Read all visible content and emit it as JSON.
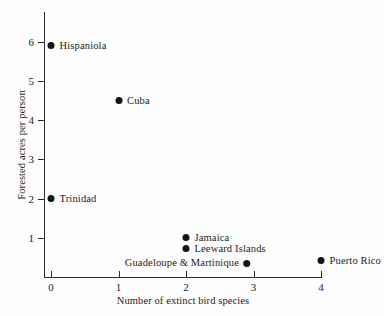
{
  "chart_data": {
    "type": "scatter",
    "title": "",
    "xlabel": "Number of extinct bird species",
    "ylabel": "Forested acres per person",
    "xlim": [
      0,
      4
    ],
    "ylim": [
      0,
      6.6
    ],
    "xticks": [
      "0",
      "1",
      "2",
      "3",
      "4"
    ],
    "xtick_values": [
      0,
      1,
      2,
      3,
      4
    ],
    "yticks": [
      "1",
      "2",
      "3",
      "4",
      "5",
      "6"
    ],
    "ytick_values": [
      1,
      2,
      3,
      4,
      5,
      6
    ],
    "grid": false,
    "legend": "none",
    "points": [
      {
        "label": "Hispaniola",
        "x": 0,
        "y": 5.9,
        "label_side": "right"
      },
      {
        "label": "Cuba",
        "x": 1,
        "y": 4.5,
        "label_side": "right"
      },
      {
        "label": "Trinidad",
        "x": 0,
        "y": 2.0,
        "label_side": "right"
      },
      {
        "label": "Jamaica",
        "x": 2,
        "y": 1.0,
        "label_side": "right"
      },
      {
        "label": "Leeward Islands",
        "x": 2,
        "y": 0.72,
        "label_side": "right"
      },
      {
        "label": "Guadeloupe & Martinique",
        "x": 3,
        "y": 0.35,
        "label_side": "left"
      },
      {
        "label": "Puerto Rico",
        "x": 4,
        "y": 0.42,
        "label_side": "right"
      }
    ]
  },
  "colors": {
    "point": "#141414",
    "axis": "#2a2a2a",
    "text": "#1a1a1a",
    "background": "#fefefe"
  }
}
